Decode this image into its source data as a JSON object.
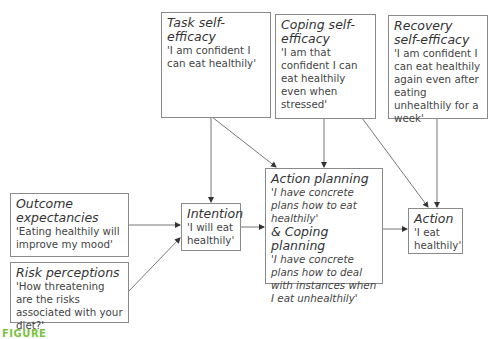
{
  "diagram": {
    "nodes": {
      "task": {
        "title": "Task self-efficacy",
        "desc": "'I am confident I can eat healthily'"
      },
      "coping": {
        "title": "Coping self-efficacy",
        "desc": "'I am that confident I can eat healthily even when stressed'"
      },
      "recovery": {
        "title": "Recovery self-efficacy",
        "desc": "'I am confident I can eat healthily again even after eating unhealthily for a week'"
      },
      "outcome": {
        "title": "Outcome expectancies",
        "desc": "'Eating healthily will improve my mood'"
      },
      "risk": {
        "title": "Risk perceptions",
        "desc": "'How threatening are the risks associated with your diet?'"
      },
      "intention": {
        "title": "Intention",
        "desc": "'I will eat healthily'"
      },
      "planning": {
        "title": "Action planning",
        "desc": "'I have concrete plans how to eat healthily'",
        "title2": "& Coping planning",
        "desc2": "'I have concrete plans how to deal with instances when I eat unhealthily'"
      },
      "action": {
        "title": "Action",
        "desc": "'I eat healthily'"
      }
    },
    "edges": [
      {
        "from": "task",
        "to": "intention"
      },
      {
        "from": "task",
        "to": "planning"
      },
      {
        "from": "coping",
        "to": "planning"
      },
      {
        "from": "coping",
        "to": "action"
      },
      {
        "from": "recovery",
        "to": "action"
      },
      {
        "from": "outcome",
        "to": "intention"
      },
      {
        "from": "risk",
        "to": "intention"
      },
      {
        "from": "intention",
        "to": "planning"
      },
      {
        "from": "planning",
        "to": "action"
      }
    ],
    "caption_fragment": "FIGURE",
    "colors": {
      "line": "#777777",
      "caption": "#7cc242"
    }
  }
}
